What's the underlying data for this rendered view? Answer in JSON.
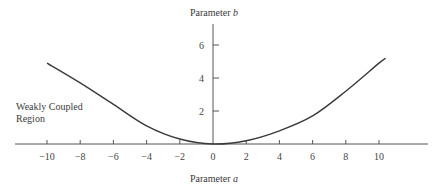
{
  "chart_data": {
    "type": "line",
    "title": "",
    "xlabel": "Parameter a",
    "ylabel": "Parameter b",
    "xlabel_parts": {
      "text": "Parameter ",
      "var": "a"
    },
    "ylabel_parts": {
      "text": "Parameter ",
      "var": "b"
    },
    "xlim": [
      -10.5,
      12.5
    ],
    "ylim": [
      0,
      7.2
    ],
    "x_ticks": [
      -10,
      -8,
      -6,
      -4,
      -2,
      0,
      2,
      4,
      6,
      8,
      10
    ],
    "y_ticks": [
      2,
      4,
      6
    ],
    "grid": false,
    "legend": null,
    "annotations": [
      {
        "text": "Weakly Coupled Region",
        "lines": [
          "Weakly Coupled",
          "Region"
        ],
        "position": "left, near b=2"
      }
    ],
    "series": [
      {
        "name": "boundary curve",
        "x": [
          -10,
          -8,
          -6,
          -4,
          -2,
          0,
          2,
          4,
          6,
          8,
          10,
          10.4
        ],
        "y": [
          4.9,
          3.7,
          2.4,
          1.1,
          0.3,
          0.0,
          0.2,
          0.8,
          1.7,
          3.2,
          4.9,
          5.2
        ]
      }
    ],
    "colors": {
      "curve": "#3a3a3a",
      "axis": "#555555"
    }
  }
}
